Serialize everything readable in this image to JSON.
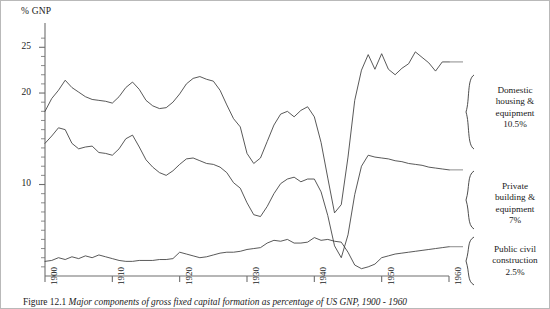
{
  "figure": {
    "caption_number": "Figure 12.1",
    "caption_text": "Major components of gross fixed capital formation as percentage of US GNP, 1900 - 1960"
  },
  "axes": {
    "y_axis_title": "% GNP",
    "y_tick_labels": [
      "25",
      "20",
      "10"
    ],
    "x_tick_labels": [
      "1900",
      "1910",
      "1920",
      "1930",
      "1940",
      "1950",
      "1960"
    ]
  },
  "series_labels": [
    {
      "name": "domestic-housing",
      "line1": "Domestic",
      "line2": "housing &",
      "line3": "equipment",
      "value": "10.5%",
      "brace": "}"
    },
    {
      "name": "private-building",
      "line1": "Private",
      "line2": "building &",
      "line3": "equipment",
      "value": "7%",
      "brace": "}"
    },
    {
      "name": "public-civil",
      "line1": "Public civil",
      "line2": "construction",
      "line3": "",
      "value": "2.5%",
      "brace": "}"
    }
  ],
  "chart_data": {
    "type": "line",
    "title": "Major components of gross fixed capital formation as percentage of US GNP, 1900 - 1960",
    "xlabel": "",
    "ylabel": "% GNP",
    "xlim": [
      1900,
      1960
    ],
    "ylim": [
      0,
      27
    ],
    "yticks_major": [
      10,
      20,
      25
    ],
    "yticks_minor_step": 1,
    "xticks": [
      1900,
      1910,
      1920,
      1930,
      1940,
      1950,
      1960
    ],
    "grid": false,
    "legend": "right-side annotations with braces",
    "line_color": "#3b3b3b",
    "x": [
      1900,
      1901,
      1902,
      1903,
      1904,
      1905,
      1906,
      1907,
      1908,
      1909,
      1910,
      1911,
      1912,
      1913,
      1914,
      1915,
      1916,
      1917,
      1918,
      1919,
      1920,
      1921,
      1922,
      1923,
      1924,
      1925,
      1926,
      1927,
      1928,
      1929,
      1930,
      1931,
      1932,
      1933,
      1934,
      1935,
      1936,
      1937,
      1938,
      1939,
      1940,
      1941,
      1942,
      1943,
      1944,
      1945,
      1946,
      1947,
      1948,
      1949,
      1950,
      1951,
      1952,
      1953,
      1954,
      1955,
      1956,
      1957,
      1958,
      1959,
      1960
    ],
    "series": [
      {
        "name": "Domestic housing & equipment",
        "label_value": "10.5%",
        "values": [
          18.0,
          19.4,
          20.3,
          21.4,
          20.6,
          20.1,
          19.6,
          19.3,
          19.2,
          19.1,
          18.9,
          19.6,
          20.6,
          21.2,
          20.4,
          19.2,
          18.6,
          18.3,
          18.4,
          19.0,
          19.9,
          21.0,
          21.6,
          21.8,
          21.5,
          21.3,
          20.3,
          18.7,
          17.2,
          16.3,
          13.4,
          12.3,
          12.9,
          14.7,
          16.5,
          17.7,
          18.0,
          17.4,
          18.1,
          18.5,
          17.4,
          14.6,
          10.7,
          6.9,
          7.8,
          13.0,
          19.2,
          22.5,
          24.2,
          22.6,
          24.3,
          22.6,
          22.0,
          22.7,
          23.2,
          24.5,
          23.9,
          23.3,
          22.4,
          23.4,
          23.4
        ]
      },
      {
        "name": "Private building & equipment",
        "label_value": "7%",
        "values": [
          14.5,
          15.3,
          16.2,
          16.0,
          14.5,
          13.9,
          14.1,
          14.2,
          13.5,
          13.4,
          13.2,
          13.9,
          15.0,
          15.4,
          14.1,
          12.7,
          11.9,
          11.3,
          11.0,
          11.5,
          12.2,
          12.8,
          12.9,
          12.6,
          12.3,
          12.2,
          11.9,
          11.3,
          10.2,
          9.6,
          8.0,
          6.7,
          6.5,
          7.6,
          9.0,
          10.1,
          10.6,
          10.8,
          10.3,
          10.6,
          10.6,
          9.2,
          6.6,
          3.3,
          2.0,
          4.5,
          8.9,
          12.0,
          13.2,
          13.0,
          12.9,
          12.8,
          12.6,
          12.5,
          12.3,
          12.2,
          12.1,
          11.9,
          11.8,
          11.7,
          11.6
        ]
      },
      {
        "name": "Public civil construction",
        "label_value": "2.5%",
        "values": [
          1.6,
          1.7,
          2.0,
          1.8,
          2.1,
          1.9,
          2.2,
          2.0,
          2.3,
          2.1,
          1.9,
          1.7,
          1.6,
          1.6,
          1.7,
          1.7,
          1.7,
          1.8,
          1.8,
          1.9,
          2.6,
          2.4,
          2.2,
          2.0,
          2.1,
          2.3,
          2.5,
          2.6,
          2.6,
          2.7,
          2.9,
          3.0,
          3.1,
          3.6,
          3.9,
          3.8,
          4.0,
          3.6,
          3.6,
          3.7,
          4.2,
          3.9,
          4.0,
          3.8,
          3.7,
          2.6,
          1.2,
          0.8,
          1.0,
          1.3,
          2.0,
          2.2,
          2.4,
          2.5,
          2.6,
          2.7,
          2.8,
          2.9,
          3.0,
          3.1,
          3.2
        ]
      }
    ]
  }
}
